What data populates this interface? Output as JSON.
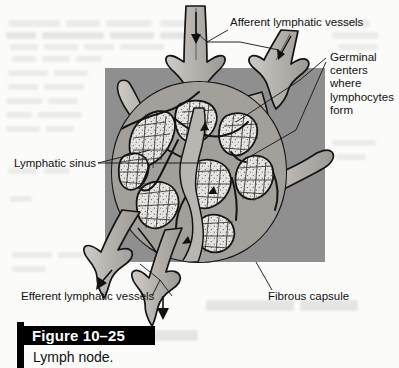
{
  "figure": {
    "number_label": "Figure 10–25",
    "caption": "Lymph node."
  },
  "canvas": {
    "width": 399,
    "height": 368,
    "page_background": "#fbfbfa",
    "panel_background": "#8f8f8f",
    "ink": "#111111",
    "tissue_fill": "#e8e6e2",
    "vessel_fill": "#b9b6b1"
  },
  "panel": {
    "name": "gray-backdrop-rectangle",
    "x": 105,
    "y": 68,
    "width": 220,
    "height": 194,
    "color": "#8f8f8f"
  },
  "labels": [
    {
      "id": "afferent",
      "text": "Afferent lymphatic vessels",
      "x": 230,
      "y": 22,
      "lines": [
        "Afferent lymphatic vessels"
      ]
    },
    {
      "id": "germinal",
      "text": "Germinal centers where lymphocytes form",
      "x": 330,
      "y": 57,
      "lines": [
        "Germinal",
        "centers",
        "where",
        "lymphocytes",
        "form"
      ]
    },
    {
      "id": "sinus",
      "text": "Lymphatic sinus",
      "x": 14,
      "y": 157,
      "lines": [
        "Lymphatic sinus"
      ]
    },
    {
      "id": "efferent",
      "text": "Efferent lymphatic vessels",
      "x": 21,
      "y": 300,
      "lines": [
        "Efferent lymphatic vessels"
      ]
    },
    {
      "id": "fibrous",
      "text": "Fibrous capsule",
      "x": 268,
      "y": 296,
      "lines": [
        "Fibrous capsule"
      ]
    }
  ],
  "anatomy": {
    "afferent_vessel_count": 2,
    "efferent_vessel_count": 2,
    "flow_arrow_direction": "downward",
    "structures": [
      "afferent lymphatic vessels",
      "fibrous capsule",
      "lymphatic sinus",
      "germinal centers",
      "efferent lymphatic vessels"
    ]
  }
}
